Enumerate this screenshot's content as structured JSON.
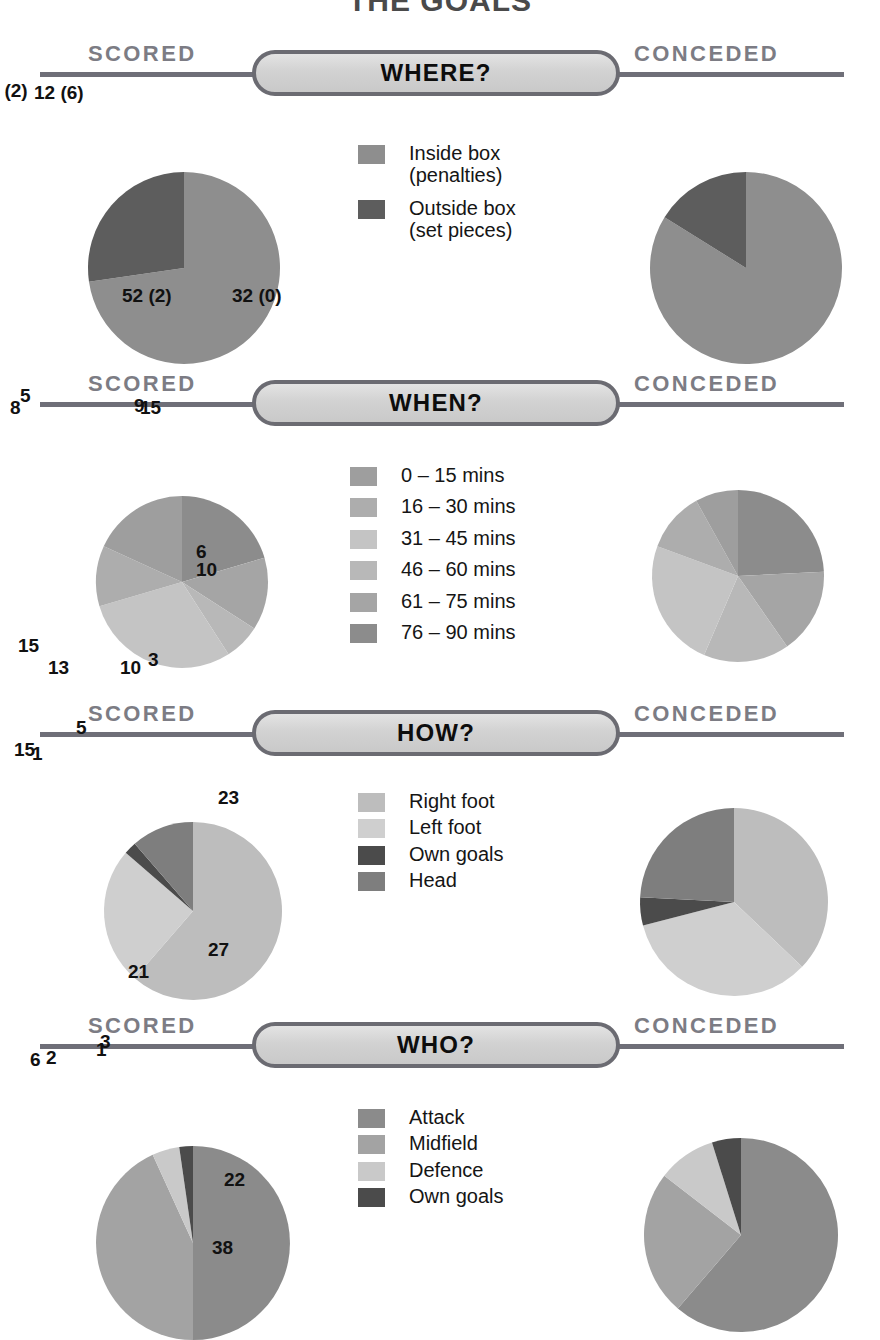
{
  "title": "THE GOALS",
  "labels": {
    "scored": "SCORED",
    "conceded": "CONCEDED"
  },
  "palette": {
    "gray1": "#808080",
    "gray2": "#8e8e8e",
    "gray3": "#9b9b9b",
    "gray4": "#a8a8a8",
    "gray5": "#b5b5b5",
    "gray6": "#c2c2c2",
    "gray7": "#cfcfcf",
    "dark": "#5a5a5a",
    "darkest": "#4b4b4b",
    "rule": "#6f6f78",
    "side_label": "#7c7c84",
    "pill_border": "#6b6b72"
  },
  "sections": [
    {
      "id": "where",
      "heading": "WHERE?",
      "legend": [
        {
          "label": "Inside box\n(penalties)",
          "color": "#8e8e8e"
        },
        {
          "label": "Outside box\n(set pieces)",
          "color": "#5d5d5d"
        }
      ],
      "scored": {
        "labels": [
          "12 (6)",
          "32 (0)"
        ]
      },
      "conceded": {
        "labels": [
          "10 (2)",
          "52 (2)"
        ]
      }
    },
    {
      "id": "when",
      "heading": "WHEN?",
      "legend": [
        {
          "label": "0 – 15 mins",
          "color": "#9e9e9e"
        },
        {
          "label": "16 – 30 mins",
          "color": "#adadad"
        },
        {
          "label": "31 – 45 mins",
          "color": "#c4c4c4"
        },
        {
          "label": "46 – 60 mins",
          "color": "#b8b8b8"
        },
        {
          "label": "61 – 75 mins",
          "color": "#a5a5a5"
        },
        {
          "label": "76 – 90 mins",
          "color": "#8c8c8c"
        }
      ],
      "scored": {
        "labels": [
          "9",
          "6",
          "3",
          "13",
          "5",
          "8"
        ]
      },
      "conceded": {
        "labels": [
          "15",
          "10",
          "10",
          "15",
          "7",
          "5"
        ]
      }
    },
    {
      "id": "how",
      "heading": "HOW?",
      "legend": [
        {
          "label": "Right foot",
          "color": "#bdbdbd"
        },
        {
          "label": "Left foot",
          "color": "#cfcfcf"
        },
        {
          "label": "Own goals",
          "color": "#4b4b4b"
        },
        {
          "label": "Head",
          "color": "#7e7e7e"
        }
      ],
      "scored": {
        "labels": [
          "27",
          "11",
          "1",
          "5"
        ]
      },
      "conceded": {
        "labels": [
          "23",
          "21",
          "3",
          "15"
        ]
      }
    },
    {
      "id": "who",
      "heading": "WHO?",
      "legend": [
        {
          "label": "Attack",
          "color": "#8b8b8b"
        },
        {
          "label": "Midfield",
          "color": "#a3a3a3"
        },
        {
          "label": "Defence",
          "color": "#c9c9c9"
        },
        {
          "label": "Own goals",
          "color": "#4b4b4b"
        }
      ],
      "scored": {
        "labels": [
          "22",
          "19",
          "2",
          "1"
        ]
      },
      "conceded": {
        "labels": [
          "38",
          "15",
          "6",
          "3"
        ]
      }
    }
  ],
  "chart_data": [
    {
      "type": "pie",
      "title": "WHERE? — Scored",
      "categories": [
        "Inside box (penalties)",
        "Outside box (set pieces)"
      ],
      "values": [
        32,
        12
      ],
      "value_labels": [
        "32 (0)",
        "12 (6)"
      ],
      "bracket_note": "number in brackets = penalties / set pieces",
      "total": 44
    },
    {
      "type": "pie",
      "title": "WHERE? — Conceded",
      "categories": [
        "Inside box (penalties)",
        "Outside box (set pieces)"
      ],
      "values": [
        52,
        10
      ],
      "value_labels": [
        "52 (2)",
        "10 (2)"
      ],
      "total": 62
    },
    {
      "type": "pie",
      "title": "WHEN? — Scored",
      "categories": [
        "0 – 15 mins",
        "16 – 30 mins",
        "31 – 45 mins",
        "46 – 60 mins",
        "61 – 75 mins",
        "76 – 90 mins"
      ],
      "values": [
        8,
        5,
        13,
        3,
        6,
        9
      ],
      "total": 44
    },
    {
      "type": "pie",
      "title": "WHEN? — Conceded",
      "categories": [
        "0 – 15 mins",
        "16 – 30 mins",
        "31 – 45 mins",
        "46 – 60 mins",
        "61 – 75 mins",
        "76 – 90 mins"
      ],
      "values": [
        5,
        7,
        15,
        10,
        10,
        15
      ],
      "total": 62
    },
    {
      "type": "pie",
      "title": "HOW? — Scored",
      "categories": [
        "Right foot",
        "Left foot",
        "Own goals",
        "Head"
      ],
      "values": [
        27,
        11,
        1,
        5
      ],
      "total": 44
    },
    {
      "type": "pie",
      "title": "HOW? — Conceded",
      "categories": [
        "Right foot",
        "Left foot",
        "Own goals",
        "Head"
      ],
      "values": [
        23,
        21,
        3,
        15
      ],
      "total": 62
    },
    {
      "type": "pie",
      "title": "WHO? — Scored",
      "categories": [
        "Attack",
        "Midfield",
        "Defence",
        "Own goals"
      ],
      "values": [
        22,
        19,
        2,
        1
      ],
      "total": 44
    },
    {
      "type": "pie",
      "title": "WHO? — Conceded",
      "categories": [
        "Attack",
        "Midfield",
        "Defence",
        "Own goals"
      ],
      "values": [
        38,
        15,
        6,
        3
      ],
      "total": 62
    }
  ]
}
